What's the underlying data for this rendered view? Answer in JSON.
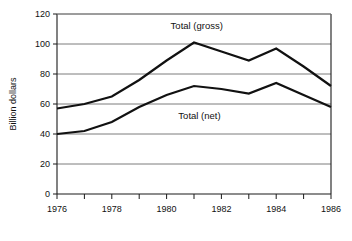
{
  "chart_data": {
    "type": "line",
    "title": "",
    "xlabel": "",
    "ylabel": "Billion dollars",
    "xlim": [
      1976,
      1986
    ],
    "ylim": [
      0,
      120
    ],
    "grid": true,
    "legend_position": "inline-annotations",
    "x": [
      1976,
      1977,
      1978,
      1979,
      1980,
      1981,
      1982,
      1983,
      1984,
      1985,
      1986
    ],
    "x_tick_labels": [
      "1976",
      "1978",
      "1980",
      "1982",
      "1984",
      "1986"
    ],
    "x_tick_values": [
      1976,
      1978,
      1980,
      1982,
      1984,
      1986
    ],
    "y_tick_labels": [
      "0",
      "20",
      "40",
      "60",
      "80",
      "100",
      "120"
    ],
    "y_tick_values": [
      0,
      20,
      40,
      60,
      80,
      100,
      120
    ],
    "series": [
      {
        "name": "Total (gross)",
        "label": "Total (gross)",
        "color": "#111111",
        "values": [
          57,
          60,
          65,
          76,
          89,
          101,
          95,
          89,
          97,
          85,
          72
        ]
      },
      {
        "name": "Total (net)",
        "label": "Total (net)",
        "color": "#111111",
        "values": [
          40,
          42,
          48,
          58,
          66,
          72,
          70,
          67,
          74,
          66,
          58
        ]
      }
    ],
    "annotations": [
      {
        "text": "Total (gross)",
        "x": 1981.1,
        "y": 110
      },
      {
        "text": "Total (net)",
        "x": 1981.2,
        "y": 50
      }
    ]
  },
  "colors": {
    "background": "#ffffff",
    "axis": "#1a1a1a",
    "grid": "#7d7d7d",
    "series": "#111111"
  }
}
